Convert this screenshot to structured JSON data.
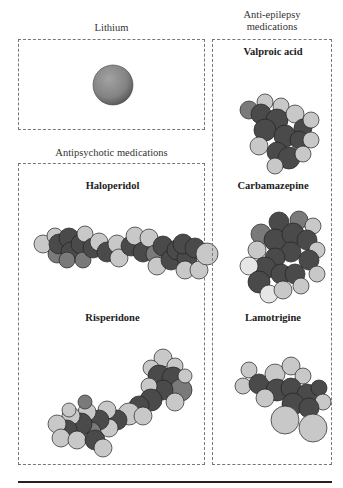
{
  "groups": {
    "lithium": {
      "title": "Lithium"
    },
    "antipsychotic": {
      "title": "Antipsychotic medications"
    },
    "antiepilepsy": {
      "title_line1": "Anti-epilepsy",
      "title_line2": "medications"
    }
  },
  "molecules": {
    "lithium": {
      "label": ""
    },
    "haloperidol": {
      "label": "Haloperidol"
    },
    "risperidone": {
      "label": "Risperidone"
    },
    "valproic": {
      "label": "Valproic acid"
    },
    "carbamazepine": {
      "label": "Carbamazepine"
    },
    "lamotrigine": {
      "label": "Lamotrigine"
    }
  },
  "colors": {
    "dark_atom": "#4a4a4a",
    "mid_atom": "#7a7a7a",
    "light_atom": "#c8c8c8",
    "white_atom": "#e6e6e6",
    "lithium": "#838383",
    "box_border": "#777777"
  },
  "atoms": {
    "haloperidol": [
      [
        6,
        20,
        9,
        "l"
      ],
      [
        18,
        12,
        8,
        "l"
      ],
      [
        20,
        30,
        9,
        "m"
      ],
      [
        22,
        20,
        10,
        "d"
      ],
      [
        32,
        14,
        10,
        "d"
      ],
      [
        34,
        28,
        10,
        "d"
      ],
      [
        44,
        20,
        10,
        "d"
      ],
      [
        30,
        36,
        8,
        "m"
      ],
      [
        46,
        36,
        8,
        "m"
      ],
      [
        48,
        10,
        8,
        "l"
      ],
      [
        56,
        24,
        10,
        "d"
      ],
      [
        62,
        18,
        9,
        "l"
      ],
      [
        70,
        28,
        10,
        "d"
      ],
      [
        80,
        20,
        9,
        "l"
      ],
      [
        82,
        34,
        9,
        "l"
      ],
      [
        94,
        22,
        10,
        "d"
      ],
      [
        98,
        12,
        9,
        "l"
      ],
      [
        106,
        28,
        10,
        "d"
      ],
      [
        112,
        14,
        9,
        "l"
      ],
      [
        118,
        30,
        9,
        "m"
      ],
      [
        126,
        22,
        10,
        "d"
      ],
      [
        120,
        42,
        9,
        "l"
      ],
      [
        134,
        36,
        10,
        "d"
      ],
      [
        140,
        26,
        10,
        "d"
      ],
      [
        150,
        34,
        10,
        "d"
      ],
      [
        146,
        20,
        10,
        "d"
      ],
      [
        158,
        24,
        10,
        "d"
      ],
      [
        148,
        46,
        9,
        "l"
      ],
      [
        162,
        46,
        9,
        "l"
      ],
      [
        170,
        30,
        11,
        "l"
      ]
    ],
    "risperidone": [
      [
        112,
        4,
        9,
        "l"
      ],
      [
        100,
        14,
        8,
        "l"
      ],
      [
        124,
        12,
        8,
        "l"
      ],
      [
        108,
        22,
        11,
        "d"
      ],
      [
        122,
        24,
        11,
        "d"
      ],
      [
        130,
        36,
        11,
        "m"
      ],
      [
        112,
        36,
        10,
        "d"
      ],
      [
        98,
        32,
        8,
        "l"
      ],
      [
        134,
        22,
        7,
        "l"
      ],
      [
        124,
        48,
        9,
        "l"
      ],
      [
        100,
        46,
        11,
        "d"
      ],
      [
        88,
        52,
        10,
        "d"
      ],
      [
        78,
        60,
        11,
        "l"
      ],
      [
        92,
        62,
        9,
        "l"
      ],
      [
        66,
        66,
        10,
        "d"
      ],
      [
        56,
        56,
        9,
        "l"
      ],
      [
        58,
        74,
        9,
        "l"
      ],
      [
        48,
        66,
        10,
        "d"
      ],
      [
        36,
        58,
        9,
        "l"
      ],
      [
        40,
        78,
        10,
        "m"
      ],
      [
        30,
        70,
        11,
        "d"
      ],
      [
        20,
        62,
        9,
        "l"
      ],
      [
        16,
        76,
        10,
        "d"
      ],
      [
        6,
        70,
        9,
        "l"
      ],
      [
        10,
        84,
        9,
        "l"
      ],
      [
        26,
        86,
        9,
        "l"
      ],
      [
        44,
        86,
        10,
        "d"
      ],
      [
        52,
        94,
        9,
        "l"
      ],
      [
        34,
        48,
        7,
        "m"
      ],
      [
        18,
        56,
        7,
        "l"
      ]
    ],
    "valproic": [
      [
        12,
        14,
        9,
        "m"
      ],
      [
        28,
        6,
        8,
        "l"
      ],
      [
        44,
        10,
        8,
        "l"
      ],
      [
        24,
        18,
        10,
        "d"
      ],
      [
        40,
        24,
        11,
        "d"
      ],
      [
        58,
        18,
        9,
        "l"
      ],
      [
        66,
        32,
        9,
        "d"
      ],
      [
        74,
        24,
        8,
        "l"
      ],
      [
        28,
        34,
        11,
        "d"
      ],
      [
        48,
        40,
        11,
        "d"
      ],
      [
        62,
        44,
        9,
        "d"
      ],
      [
        74,
        44,
        8,
        "l"
      ],
      [
        22,
        50,
        9,
        "l"
      ],
      [
        40,
        56,
        10,
        "d"
      ],
      [
        52,
        62,
        11,
        "d"
      ],
      [
        38,
        70,
        8,
        "l"
      ],
      [
        66,
        58,
        8,
        "l"
      ]
    ],
    "carbamazepine": [
      [
        40,
        6,
        10,
        "d"
      ],
      [
        60,
        4,
        9,
        "m"
      ],
      [
        74,
        10,
        8,
        "l"
      ],
      [
        22,
        18,
        10,
        "m"
      ],
      [
        18,
        34,
        9,
        "l"
      ],
      [
        36,
        24,
        11,
        "d"
      ],
      [
        54,
        18,
        11,
        "d"
      ],
      [
        68,
        24,
        10,
        "d"
      ],
      [
        78,
        34,
        8,
        "l"
      ],
      [
        52,
        36,
        10,
        "d"
      ],
      [
        70,
        44,
        10,
        "d"
      ],
      [
        78,
        58,
        8,
        "l"
      ],
      [
        36,
        42,
        10,
        "d"
      ],
      [
        26,
        52,
        11,
        "d"
      ],
      [
        10,
        50,
        9,
        "white"
      ],
      [
        42,
        58,
        10,
        "d"
      ],
      [
        56,
        58,
        10,
        "d"
      ],
      [
        62,
        70,
        8,
        "l"
      ],
      [
        20,
        66,
        11,
        "d"
      ],
      [
        30,
        78,
        9,
        "white"
      ],
      [
        44,
        74,
        9,
        "l"
      ]
    ],
    "lamotrigine": [
      [
        16,
        12,
        8,
        "l"
      ],
      [
        10,
        28,
        8,
        "l"
      ],
      [
        26,
        26,
        10,
        "d"
      ],
      [
        42,
        16,
        10,
        "l"
      ],
      [
        58,
        8,
        9,
        "l"
      ],
      [
        70,
        18,
        8,
        "l"
      ],
      [
        44,
        32,
        11,
        "d"
      ],
      [
        58,
        30,
        10,
        "d"
      ],
      [
        74,
        36,
        10,
        "d"
      ],
      [
        86,
        30,
        8,
        "d"
      ],
      [
        90,
        44,
        8,
        "l"
      ],
      [
        32,
        40,
        9,
        "l"
      ],
      [
        60,
        46,
        11,
        "d"
      ],
      [
        76,
        50,
        10,
        "d"
      ],
      [
        52,
        62,
        14,
        "l"
      ],
      [
        80,
        70,
        14,
        "l"
      ]
    ]
  }
}
